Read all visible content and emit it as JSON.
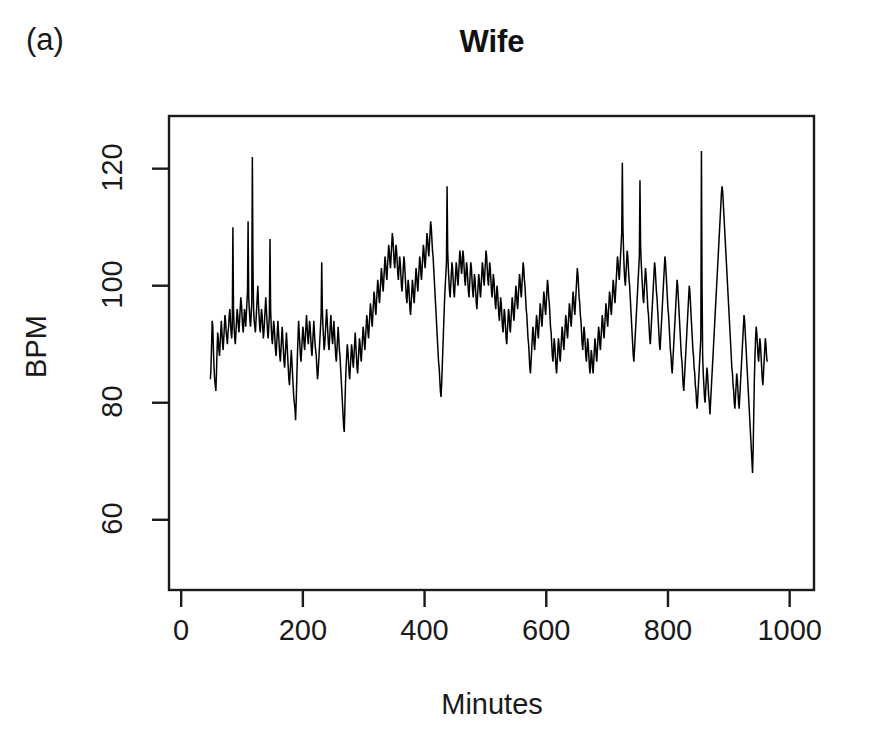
{
  "figure": {
    "panel_label": "(a)",
    "title": "Wife",
    "background_color": "#ffffff",
    "line_color": "#000000",
    "axis_color": "#1a1a1a"
  },
  "axis": {
    "x_label": "Minutes",
    "y_label": "BPM",
    "x_ticks": [
      "0",
      "200",
      "400",
      "600",
      "800",
      "1000"
    ],
    "y_ticks": [
      "60",
      "80",
      "100",
      "120"
    ]
  },
  "chart_data": {
    "type": "line",
    "title": "Wife",
    "subtitle": "(a)",
    "xlabel": "Minutes",
    "ylabel": "BPM",
    "xlim": [
      -20,
      1040
    ],
    "ylim": [
      48,
      129
    ],
    "x_ticks": [
      0,
      200,
      400,
      600,
      800,
      1000
    ],
    "y_ticks": [
      60,
      80,
      100,
      120
    ],
    "grid": false,
    "legend": null,
    "series": [
      {
        "name": "Wife heart rate",
        "x_start": 48,
        "x_end": 975,
        "x_step": 1,
        "units": "BPM",
        "values": [
          84,
          86,
          90,
          94,
          93,
          89,
          86,
          84,
          83,
          82,
          85,
          89,
          92,
          91,
          89,
          88,
          90,
          92,
          94,
          92,
          90,
          89,
          91,
          93,
          95,
          94,
          92,
          91,
          90,
          92,
          93,
          95,
          96,
          94,
          92,
          91,
          93,
          110,
          96,
          93,
          91,
          90,
          92,
          94,
          96,
          95,
          93,
          92,
          94,
          96,
          98,
          97,
          95,
          93,
          92,
          94,
          96,
          95,
          93,
          95,
          97,
          99,
          111,
          98,
          96,
          94,
          93,
          95,
          97,
          122,
          103,
          96,
          94,
          93,
          92,
          94,
          96,
          98,
          100,
          97,
          95,
          93,
          92,
          94,
          96,
          95,
          93,
          91,
          92,
          94,
          96,
          98,
          96,
          94,
          92,
          91,
          93,
          95,
          108,
          96,
          93,
          91,
          90,
          92,
          94,
          93,
          91,
          89,
          88,
          90,
          92,
          94,
          92,
          90,
          88,
          87,
          89,
          91,
          93,
          91,
          89,
          87,
          86,
          88,
          90,
          92,
          90,
          88,
          86,
          84,
          83,
          85,
          87,
          89,
          87,
          85,
          83,
          81,
          80,
          79,
          77,
          80,
          84,
          88,
          91,
          94,
          92,
          90,
          88,
          87,
          89,
          91,
          93,
          92,
          90,
          89,
          91,
          93,
          95,
          93,
          91,
          90,
          92,
          94,
          93,
          91,
          89,
          88,
          90,
          92,
          94,
          92,
          90,
          89,
          88,
          86,
          84,
          85,
          87,
          89,
          91,
          93,
          95,
          104,
          96,
          93,
          91,
          89,
          90,
          92,
          94,
          96,
          94,
          92,
          90,
          89,
          91,
          93,
          95,
          93,
          91,
          90,
          92,
          94,
          92,
          90,
          88,
          87,
          89,
          91,
          93,
          91,
          89,
          88,
          86,
          84,
          82,
          80,
          78,
          76,
          75,
          79,
          83,
          86,
          88,
          90,
          89,
          87,
          85,
          84,
          86,
          88,
          90,
          89,
          87,
          86,
          88,
          90,
          92,
          90,
          88,
          86,
          85,
          87,
          89,
          91,
          90,
          88,
          87,
          89,
          91,
          93,
          92,
          90,
          89,
          91,
          93,
          95,
          94,
          92,
          91,
          93,
          95,
          97,
          96,
          94,
          93,
          95,
          97,
          99,
          98,
          96,
          95,
          97,
          99,
          101,
          100,
          98,
          97,
          99,
          101,
          103,
          102,
          100,
          99,
          101,
          103,
          105,
          104,
          102,
          101,
          103,
          105,
          107,
          106,
          104,
          103,
          105,
          107,
          109,
          108,
          106,
          104,
          103,
          105,
          107,
          106,
          104,
          102,
          101,
          103,
          105,
          104,
          102,
          100,
          99,
          101,
          103,
          105,
          104,
          102,
          100,
          98,
          97,
          99,
          101,
          100,
          98,
          96,
          95,
          97,
          99,
          101,
          100,
          98,
          97,
          99,
          101,
          103,
          102,
          100,
          99,
          101,
          103,
          105,
          104,
          102,
          101,
          103,
          105,
          107,
          106,
          104,
          103,
          105,
          107,
          109,
          108,
          106,
          105,
          107,
          109,
          111,
          110,
          108,
          106,
          105,
          103,
          101,
          99,
          97,
          95,
          93,
          91,
          89,
          87,
          86,
          84,
          82,
          81,
          83,
          86,
          89,
          92,
          95,
          98,
          100,
          102,
          104,
          117,
          106,
          103,
          101,
          99,
          98,
          100,
          102,
          104,
          103,
          101,
          99,
          98,
          100,
          102,
          104,
          103,
          101,
          100,
          102,
          104,
          106,
          105,
          103,
          102,
          104,
          106,
          105,
          103,
          101,
          100,
          102,
          104,
          103,
          101,
          99,
          98,
          100,
          102,
          104,
          103,
          101,
          99,
          98,
          100,
          102,
          101,
          99,
          97,
          96,
          98,
          100,
          102,
          101,
          99,
          98,
          100,
          102,
          104,
          103,
          101,
          100,
          102,
          104,
          106,
          105,
          103,
          101,
          100,
          102,
          104,
          103,
          101,
          99,
          98,
          100,
          102,
          101,
          99,
          97,
          96,
          98,
          100,
          99,
          97,
          95,
          94,
          96,
          98,
          97,
          95,
          93,
          92,
          94,
          96,
          95,
          93,
          91,
          90,
          92,
          94,
          96,
          95,
          93,
          92,
          94,
          96,
          98,
          97,
          95,
          94,
          96,
          98,
          100,
          99,
          97,
          96,
          98,
          100,
          102,
          101,
          99,
          98,
          100,
          102,
          104,
          103,
          101,
          100,
          98,
          96,
          95,
          93,
          91,
          90,
          88,
          86,
          85,
          87,
          89,
          91,
          93,
          92,
          90,
          89,
          91,
          93,
          95,
          94,
          92,
          91,
          93,
          95,
          97,
          96,
          94,
          93,
          95,
          97,
          99,
          98,
          96,
          95,
          97,
          99,
          101,
          100,
          98,
          97,
          95,
          93,
          92,
          90,
          88,
          87,
          89,
          91,
          90,
          88,
          86,
          85,
          87,
          89,
          91,
          90,
          88,
          87,
          89,
          91,
          93,
          92,
          90,
          89,
          91,
          93,
          95,
          94,
          92,
          91,
          93,
          95,
          97,
          96,
          94,
          93,
          95,
          97,
          99,
          98,
          96,
          95,
          97,
          99,
          101,
          103,
          102,
          100,
          98,
          97,
          95,
          94,
          92,
          90,
          89,
          91,
          93,
          92,
          90,
          88,
          87,
          89,
          91,
          90,
          88,
          86,
          85,
          87,
          89,
          88,
          86,
          85,
          87,
          89,
          91,
          90,
          88,
          87,
          89,
          91,
          93,
          92,
          90,
          89,
          91,
          93,
          95,
          94,
          92,
          91,
          93,
          95,
          97,
          96,
          94,
          93,
          95,
          97,
          99,
          98,
          96,
          95,
          97,
          99,
          101,
          100,
          98,
          97,
          99,
          101,
          103,
          105,
          104,
          102,
          101,
          103,
          105,
          107,
          109,
          121,
          110,
          106,
          103,
          101,
          100,
          102,
          104,
          106,
          105,
          103,
          101,
          100,
          98,
          96,
          94,
          92,
          90,
          88,
          87,
          89,
          91,
          93,
          95,
          97,
          99,
          101,
          103,
          105,
          118,
          107,
          104,
          102,
          100,
          98,
          97,
          99,
          101,
          103,
          102,
          100,
          98,
          96,
          95,
          93,
          91,
          90,
          92,
          94,
          96,
          98,
          100,
          102,
          104,
          103,
          101,
          99,
          98,
          96,
          94,
          92,
          90,
          89,
          91,
          93,
          95,
          97,
          99,
          101,
          103,
          105,
          104,
          102,
          100,
          98,
          96,
          95,
          93,
          91,
          89,
          88,
          86,
          85,
          87,
          89,
          91,
          93,
          95,
          97,
          99,
          101,
          100,
          98,
          96,
          94,
          92,
          90,
          88,
          87,
          85,
          83,
          82,
          84,
          86,
          88,
          90,
          92,
          94,
          96,
          98,
          100,
          99,
          97,
          95,
          93,
          91,
          89,
          88,
          86,
          85,
          83,
          82,
          80,
          79,
          81,
          83,
          85,
          87,
          89,
          91,
          123,
          100,
          88,
          85,
          83,
          81,
          80,
          82,
          84,
          86,
          85,
          83,
          81,
          80,
          78,
          80,
          82,
          84,
          86,
          88,
          90,
          92,
          94,
          96,
          98,
          100,
          102,
          104,
          106,
          108,
          110,
          112,
          114,
          116,
          117,
          116,
          114,
          112,
          110,
          108,
          106,
          104,
          102,
          100,
          98,
          96,
          94,
          92,
          90,
          88,
          86,
          85,
          83,
          82,
          80,
          79,
          81,
          83,
          85,
          84,
          82,
          80,
          79,
          81,
          83,
          85,
          87,
          89,
          91,
          93,
          95,
          94,
          92,
          90,
          88,
          86,
          84,
          82,
          80,
          78,
          76,
          74,
          72,
          70,
          68,
          72,
          78,
          84,
          88,
          91,
          93,
          92,
          90,
          88,
          87,
          89,
          91,
          90,
          88,
          86,
          84,
          83,
          85,
          87,
          89,
          91,
          90,
          88,
          87
        ]
      }
    ]
  }
}
